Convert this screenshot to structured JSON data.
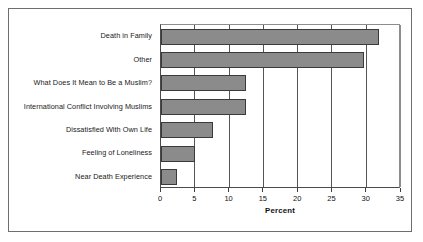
{
  "chart_data": {
    "type": "bar",
    "orientation": "horizontal",
    "title": "",
    "subtitle": "",
    "xlabel": "Percent",
    "ylabel": "",
    "xlim": [
      0,
      35
    ],
    "xticks": [
      "0",
      "5",
      "10",
      "15",
      "20",
      "25",
      "30",
      "35"
    ],
    "xtick_values": [
      0,
      5,
      10,
      15,
      20,
      25,
      30,
      35
    ],
    "grid": true,
    "grid_axis": "x",
    "legend": null,
    "legend_position": "none",
    "categories": [
      "Death in Family",
      "Other",
      "What Does It Mean to Be a Muslim?",
      "International Conflict Involving Muslims",
      "Dissatisfied With Own Life",
      "Feeling of Loneliness",
      "Near Death Experience"
    ],
    "values": [
      31.8,
      29.6,
      12.4,
      12.4,
      7.6,
      4.9,
      2.4
    ],
    "bar_fill_color": "#8b8b8b",
    "bar_edge_color": "#3a3a3a",
    "axis_color": "#4a4a4a",
    "background_color": "#ffffff"
  }
}
